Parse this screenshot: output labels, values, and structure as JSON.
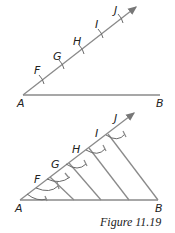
{
  "figure": {
    "caption": "Figure 11.19",
    "top": {
      "labels": {
        "A": "A",
        "B": "B",
        "F": "F",
        "G": "G",
        "H": "H",
        "I": "I",
        "J": "J"
      }
    },
    "bottom": {
      "labels": {
        "A": "A",
        "B": "B",
        "F": "F",
        "G": "G",
        "H": "H",
        "I": "I",
        "J": "J"
      }
    }
  }
}
